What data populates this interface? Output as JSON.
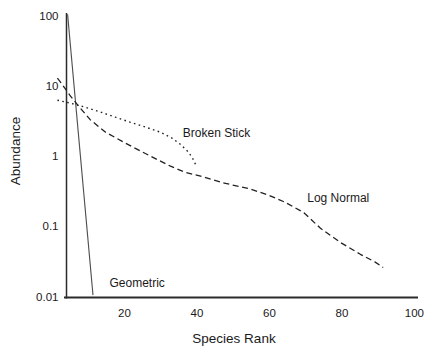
{
  "figure": {
    "background": "#ffffff",
    "axis_color": "#2b2b2b",
    "text_color": "#1a1a1a"
  },
  "chart_data": {
    "type": "line",
    "title": "",
    "xlabel": "Species Rank",
    "ylabel": "Abundance",
    "x_scale": "linear",
    "y_scale": "log",
    "xlim": [
      4,
      101
    ],
    "ylim": [
      0.0097,
      110
    ],
    "grid": false,
    "legend_position": "none",
    "x_ticks": [
      20,
      40,
      60,
      80,
      100
    ],
    "x_tick_labels": [
      "20",
      "40",
      "60",
      "80",
      "100"
    ],
    "y_ticks": [
      100,
      10,
      1,
      0.1,
      0.01
    ],
    "y_tick_labels": [
      "100",
      "10",
      "1",
      "0.1",
      "0.01"
    ],
    "series": [
      {
        "name": "Geometric",
        "style": "solid",
        "color": "#4d4d4d",
        "width": 1.1,
        "points": [
          [
            4.3,
            105
          ],
          [
            11.3,
            0.0105
          ]
        ]
      },
      {
        "name": "Broken Stick",
        "style": "dotted",
        "color": "#222222",
        "width": 1.4,
        "points": [
          [
            1.5,
            6.3
          ],
          [
            5.1,
            5.7
          ],
          [
            9.2,
            5.0
          ],
          [
            13.4,
            4.25
          ],
          [
            17.5,
            3.6
          ],
          [
            21.7,
            3.05
          ],
          [
            25.8,
            2.6
          ],
          [
            29.9,
            2.2
          ],
          [
            33.2,
            1.8
          ],
          [
            35.4,
            1.48
          ],
          [
            37.7,
            1.14
          ],
          [
            39.1,
            0.88
          ],
          [
            39.9,
            0.7
          ]
        ]
      },
      {
        "name": "Log Normal",
        "style": "dashed",
        "color": "#222222",
        "width": 1.3,
        "points": [
          [
            1.5,
            13.0
          ],
          [
            2.3,
            11.5
          ],
          [
            5.1,
            7.2
          ],
          [
            7.3,
            5.2
          ],
          [
            10.6,
            3.3
          ],
          [
            14.8,
            2.2
          ],
          [
            20.3,
            1.53
          ],
          [
            27.2,
            1.0
          ],
          [
            32.7,
            0.72
          ],
          [
            36.8,
            0.59
          ],
          [
            41.0,
            0.52
          ],
          [
            47.9,
            0.41
          ],
          [
            54.8,
            0.34
          ],
          [
            59.7,
            0.28
          ],
          [
            64.4,
            0.22
          ],
          [
            69.5,
            0.157
          ],
          [
            74.1,
            0.094
          ],
          [
            79.6,
            0.059
          ],
          [
            85.1,
            0.04
          ],
          [
            89.2,
            0.031
          ],
          [
            91.4,
            0.026
          ]
        ]
      }
    ],
    "annotations": [
      {
        "text": "Broken Stick",
        "x": 45.4,
        "y": 2.13
      },
      {
        "text": "Log Normal",
        "x": 79.0,
        "y": 0.25
      },
      {
        "text": "Geometric",
        "x": 23.5,
        "y": 0.0155
      }
    ]
  }
}
